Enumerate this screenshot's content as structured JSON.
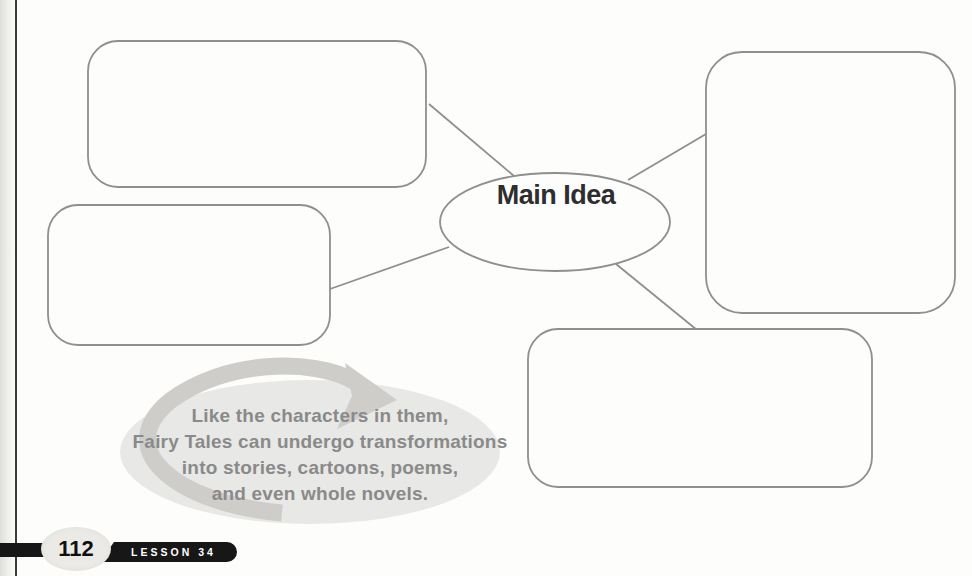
{
  "page": {
    "background": "#fdfdfc",
    "margin_rule_color": "#3a3a3a"
  },
  "diagram": {
    "center_label": "Main Idea",
    "center_label_color": "#2e2e2e",
    "stroke_color": "#8f8f8f",
    "boxes": [
      {
        "position": "top-left",
        "value": ""
      },
      {
        "position": "middle-left",
        "value": ""
      },
      {
        "position": "right",
        "value": ""
      },
      {
        "position": "bottom-center",
        "value": ""
      }
    ]
  },
  "callout": {
    "lines": [
      "Like the characters in them,",
      "Fairy Tales can undergo transformations",
      "into stories, cartoons, poems,",
      "and even whole novels."
    ],
    "text_color": "#8a8a8a",
    "ellipse_color": "#e8e8e6",
    "arrow_color": "#cecdca"
  },
  "footer": {
    "page_number": "112",
    "lesson_label": "LESSON 34",
    "bar_color": "#171717",
    "pill_color": "#171717",
    "pill_text_color": "#ffffff",
    "bubble_color": "#eceae7",
    "page_number_color": "#101010"
  }
}
